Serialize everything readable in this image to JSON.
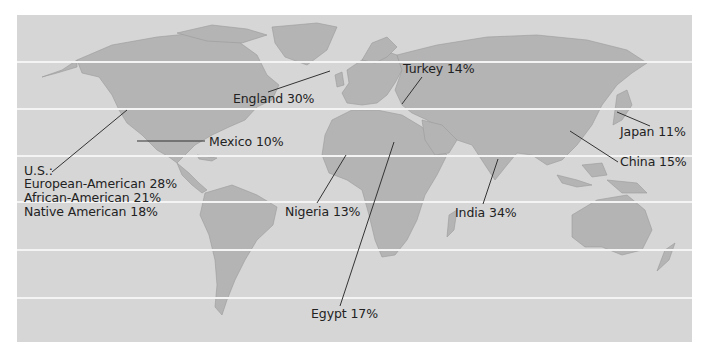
{
  "map": {
    "type": "world-map",
    "background_color": "#ffffff",
    "ocean_color": "#d6d6d6",
    "land_color": "#b4b4b4",
    "latitude_line_color": "#f4f4f4",
    "label_color": "#222222"
  },
  "labels": {
    "england": "England 30%",
    "turkey": "Turkey 14%",
    "mexico": "Mexico 10%",
    "japan": "Japan 11%",
    "china": "China 15%",
    "us_heading": "U.S.:",
    "us_european": "European-American 28%",
    "us_african": "African-American 21%",
    "us_native": "Native American 18%",
    "nigeria": "Nigeria 13%",
    "india": "India 34%",
    "egypt": "Egypt 17%"
  },
  "data_points": [
    {
      "region": "England",
      "value": 30
    },
    {
      "region": "Turkey",
      "value": 14
    },
    {
      "region": "Mexico",
      "value": 10
    },
    {
      "region": "Japan",
      "value": 11
    },
    {
      "region": "China",
      "value": 15
    },
    {
      "region": "U.S. European-American",
      "value": 28
    },
    {
      "region": "U.S. African-American",
      "value": 21
    },
    {
      "region": "U.S. Native American",
      "value": 18
    },
    {
      "region": "Nigeria",
      "value": 13
    },
    {
      "region": "India",
      "value": 34
    },
    {
      "region": "Egypt",
      "value": 17
    }
  ]
}
